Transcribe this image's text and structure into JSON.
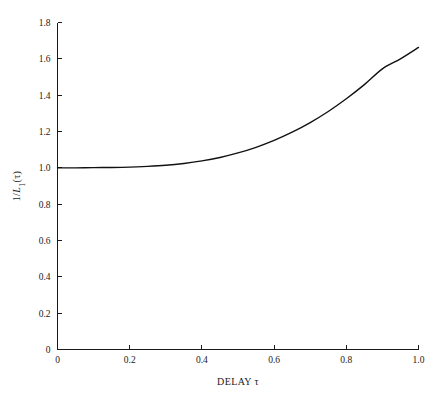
{
  "chart_data": {
    "type": "line",
    "title": "",
    "xlabel": "DELAY τ",
    "ylabel": "1/L₁(τ)",
    "xlim": [
      0,
      1.0
    ],
    "ylim": [
      0,
      1.8
    ],
    "grid": false,
    "legend": null,
    "xticks": [
      0,
      0.2,
      0.4,
      0.6,
      0.8,
      1.0
    ],
    "xtick_labels": [
      "0",
      "0.2",
      "0.4",
      "0.6",
      "0.8",
      "1.0"
    ],
    "yticks": [
      0,
      0.2,
      0.4,
      0.6,
      0.8,
      1.0,
      1.2,
      1.4,
      1.6,
      1.8
    ],
    "ytick_labels": [
      "0",
      "0.2",
      "0.4",
      "0.6",
      "0.8",
      "1.0",
      "1.2",
      "1.4",
      "1.6",
      "1.8"
    ],
    "series": [
      {
        "name": "1/L1(tau)",
        "color": "#111111",
        "x": [
          0.0,
          0.05,
          0.1,
          0.15,
          0.2,
          0.25,
          0.3,
          0.35,
          0.4,
          0.45,
          0.5,
          0.55,
          0.6,
          0.65,
          0.7,
          0.75,
          0.8,
          0.85,
          0.9,
          0.95,
          1.0
        ],
        "y": [
          1.0,
          1.0,
          1.001,
          1.002,
          1.004,
          1.008,
          1.014,
          1.024,
          1.038,
          1.057,
          1.082,
          1.113,
          1.151,
          1.196,
          1.249,
          1.31,
          1.38,
          1.458,
          1.545,
          1.6,
          1.663
        ]
      }
    ]
  },
  "axis_style": {
    "tick_direction": "in",
    "spines": [
      "left",
      "bottom"
    ]
  }
}
